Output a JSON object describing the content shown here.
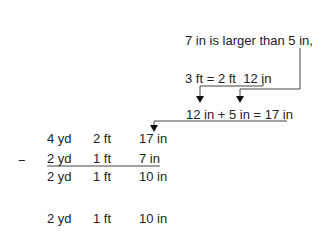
{
  "annotations": {
    "comparison": "7 in is larger than 5 in,",
    "conversion": "3 ft = 2 ft  12 in",
    "addition": "12 in + 5 in = 17 in"
  },
  "subtraction": {
    "operator": "−",
    "minuend": {
      "yd": "4 yd",
      "ft": "2 ft",
      "in": "17 in"
    },
    "subtrahend": {
      "yd": "2 yd",
      "ft": "1 ft",
      "in": "7 in"
    },
    "difference": {
      "yd": "2 yd",
      "ft": "1 ft",
      "in": "10 in"
    }
  },
  "answer": {
    "yd": "2 yd",
    "ft": "1 ft",
    "in": "10 in"
  }
}
